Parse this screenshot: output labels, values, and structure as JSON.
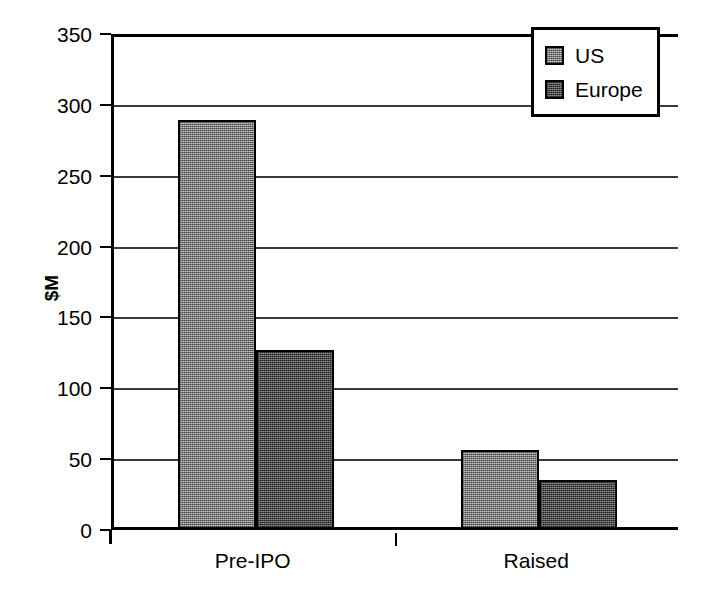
{
  "chart_data": {
    "type": "bar",
    "title": "",
    "subtitle": "",
    "xlabel": "",
    "ylabel": "$M",
    "categories": [
      "Pre-IPO",
      "Raised"
    ],
    "series": [
      {
        "name": "US",
        "values": [
          287,
          54
        ],
        "color": "#8a8a8a"
      },
      {
        "name": "Europe",
        "values": [
          125,
          33
        ],
        "color": "#555555"
      }
    ],
    "ylim": [
      0,
      350
    ],
    "y_ticks": [
      0,
      50,
      100,
      150,
      200,
      250,
      300,
      350
    ],
    "y_tick_labels": [
      "0",
      "50",
      "100",
      "150",
      "200",
      "250",
      "300",
      "350"
    ],
    "grid": {
      "horizontal": true,
      "vertical": false
    },
    "legend": {
      "position": "top-right-inside",
      "border": true
    },
    "annotations": []
  },
  "axes": {
    "y_title": "$M",
    "y_tick_labels": [
      "350",
      "300",
      "250",
      "200",
      "150",
      "100",
      "50",
      "0"
    ],
    "x_category_labels": [
      "Pre-IPO",
      "Raised"
    ]
  },
  "legend": {
    "entries": [
      {
        "label": "US",
        "swatch_color": "#8a8a8a"
      },
      {
        "label": "Europe",
        "swatch_color": "#555555"
      }
    ]
  }
}
